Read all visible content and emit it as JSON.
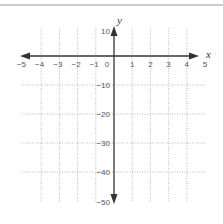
{
  "figure": {
    "type": "coordinate-plane",
    "x_axis": {
      "label": "x",
      "ticks": [
        {
          "value": -5,
          "label": "−5"
        },
        {
          "value": -4,
          "label": "−4"
        },
        {
          "value": -3,
          "label": "−3"
        },
        {
          "value": -2,
          "label": "−2"
        },
        {
          "value": -1,
          "label": "−1"
        },
        {
          "value": 0,
          "label": "0"
        },
        {
          "value": 1,
          "label": "1"
        },
        {
          "value": 2,
          "label": "2"
        },
        {
          "value": 3,
          "label": "3"
        },
        {
          "value": 4,
          "label": "4"
        },
        {
          "value": 5,
          "label": "5"
        }
      ],
      "range": [
        -5,
        5
      ]
    },
    "y_axis": {
      "label": "y",
      "ticks": [
        {
          "value": 10,
          "label": "10"
        },
        {
          "value": -10,
          "label": "−10"
        },
        {
          "value": -20,
          "label": "−20"
        },
        {
          "value": -30,
          "label": "−30"
        },
        {
          "value": -40,
          "label": "−40"
        },
        {
          "value": -50,
          "label": "−50"
        }
      ],
      "range": [
        -50,
        10
      ]
    },
    "grid": "dotted",
    "colors": {
      "axis": "#333333",
      "grid": "#a8a8a8",
      "frame": "#9a9a9a",
      "text": "#555555"
    }
  }
}
